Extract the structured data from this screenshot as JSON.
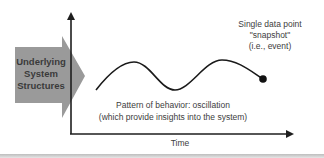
{
  "diagram": {
    "structures_box": {
      "lines": [
        "Underlying",
        "System",
        "Structures"
      ],
      "fill_color": "#9a9a9a",
      "icon": "right-arrow-shape"
    },
    "snapshot": {
      "lines": [
        "Single data point",
        "\"snapshot\"",
        "(i.e., event)"
      ],
      "marker": "filled-circle"
    },
    "pattern": {
      "lines": [
        "Pattern of behavior:  oscillation",
        "(which provide insights into the system)"
      ]
    },
    "axes": {
      "x_label": "Time",
      "y_label": "",
      "axis_color": "#222222"
    },
    "curve": {
      "description": "oscillating wave ending in a data point",
      "color": "#1a1a1a"
    }
  }
}
